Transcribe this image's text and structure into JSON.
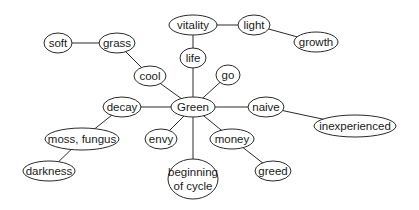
{
  "diagram": {
    "type": "mind-map",
    "central": "green",
    "nodes": [
      {
        "id": "green",
        "lines": [
          "Green"
        ],
        "x": 193,
        "y": 107,
        "rx": 22,
        "ry": 10
      },
      {
        "id": "life",
        "lines": [
          "life"
        ],
        "x": 193,
        "y": 58,
        "rx": 13,
        "ry": 10
      },
      {
        "id": "vitality",
        "lines": [
          "vitality"
        ],
        "x": 193,
        "y": 25,
        "rx": 24,
        "ry": 10
      },
      {
        "id": "light",
        "lines": [
          "light"
        ],
        "x": 254,
        "y": 25,
        "rx": 16,
        "ry": 10
      },
      {
        "id": "growth",
        "lines": [
          "growth"
        ],
        "x": 316,
        "y": 42,
        "rx": 22,
        "ry": 10
      },
      {
        "id": "go",
        "lines": [
          "go"
        ],
        "x": 228,
        "y": 75,
        "rx": 12,
        "ry": 10
      },
      {
        "id": "cool",
        "lines": [
          "cool"
        ],
        "x": 150,
        "y": 76,
        "rx": 16,
        "ry": 10
      },
      {
        "id": "grass",
        "lines": [
          "grass"
        ],
        "x": 117,
        "y": 43,
        "rx": 18,
        "ry": 10
      },
      {
        "id": "soft",
        "lines": [
          "soft"
        ],
        "x": 58,
        "y": 43,
        "rx": 14,
        "ry": 10
      },
      {
        "id": "naive",
        "lines": [
          "naive"
        ],
        "x": 266,
        "y": 107,
        "rx": 18,
        "ry": 10
      },
      {
        "id": "inexperienced",
        "lines": [
          "inexperienced"
        ],
        "x": 355,
        "y": 126,
        "rx": 41,
        "ry": 11
      },
      {
        "id": "decay",
        "lines": [
          "decay"
        ],
        "x": 122,
        "y": 107,
        "rx": 19,
        "ry": 10
      },
      {
        "id": "moss_fungus",
        "lines": [
          "moss, fungus"
        ],
        "x": 82,
        "y": 139,
        "rx": 37,
        "ry": 11
      },
      {
        "id": "darkness",
        "lines": [
          "darkness"
        ],
        "x": 49,
        "y": 171,
        "rx": 26,
        "ry": 10
      },
      {
        "id": "envy",
        "lines": [
          "envy"
        ],
        "x": 161,
        "y": 139,
        "rx": 16,
        "ry": 10
      },
      {
        "id": "money",
        "lines": [
          "money"
        ],
        "x": 232,
        "y": 139,
        "rx": 22,
        "ry": 10
      },
      {
        "id": "greed",
        "lines": [
          "greed"
        ],
        "x": 273,
        "y": 171,
        "rx": 18,
        "ry": 10
      },
      {
        "id": "beginning_of_cycle",
        "lines": [
          "beginning",
          "of cycle"
        ],
        "x": 193,
        "y": 179,
        "rx": 25,
        "ry": 20
      }
    ],
    "edges": [
      [
        "green",
        "life"
      ],
      [
        "life",
        "vitality"
      ],
      [
        "vitality",
        "light"
      ],
      [
        "light",
        "growth"
      ],
      [
        "green",
        "go"
      ],
      [
        "green",
        "cool"
      ],
      [
        "cool",
        "grass"
      ],
      [
        "grass",
        "soft"
      ],
      [
        "green",
        "naive"
      ],
      [
        "naive",
        "inexperienced"
      ],
      [
        "green",
        "decay"
      ],
      [
        "decay",
        "moss_fungus"
      ],
      [
        "moss_fungus",
        "darkness"
      ],
      [
        "green",
        "envy"
      ],
      [
        "green",
        "money"
      ],
      [
        "money",
        "greed"
      ],
      [
        "green",
        "beginning_of_cycle"
      ]
    ]
  }
}
